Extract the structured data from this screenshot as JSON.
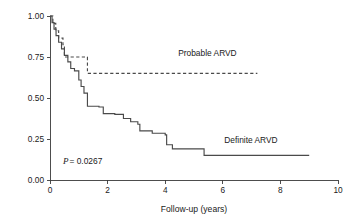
{
  "chart_data": {
    "type": "line",
    "title": "",
    "subtitle": "",
    "xlabel": "Follow-up (years)",
    "ylabel": "",
    "xlim": [
      0,
      10
    ],
    "ylim": [
      0,
      1
    ],
    "grid": false,
    "legend_position": "inline-annotation",
    "xticks": [
      0,
      2,
      4,
      6,
      8,
      10
    ],
    "xticklabels": [
      "0",
      "2",
      "4",
      "6",
      "8",
      "10"
    ],
    "yticks": [
      0,
      0.25,
      0.5,
      0.75,
      1
    ],
    "yticklabels": [
      "0.00",
      "0.25",
      "0.50",
      "0.75",
      "1.00"
    ],
    "annotations": [
      {
        "name": "p-value",
        "p_symbol": "P",
        "text": " = 0.0267",
        "x": 0.45,
        "y": 0.095
      }
    ],
    "series": [
      {
        "name": "Definite ARVD",
        "style": "solid",
        "label": "Definite ARVD",
        "label_x": 6.05,
        "label_y": 0.225,
        "step": "post",
        "x": [
          0.0,
          0.07,
          0.14,
          0.21,
          0.3,
          0.4,
          0.5,
          0.62,
          0.72,
          0.85,
          1.0,
          1.08,
          1.18,
          1.3,
          1.7,
          1.85,
          2.25,
          2.55,
          2.8,
          3.05,
          3.12,
          3.55,
          4.0,
          4.05,
          4.25,
          5.35,
          9.0
        ],
        "y": [
          1.0,
          0.96,
          0.92,
          0.88,
          0.84,
          0.8,
          0.76,
          0.72,
          0.68,
          0.665,
          0.61,
          0.57,
          0.53,
          0.45,
          0.445,
          0.405,
          0.4,
          0.375,
          0.355,
          0.34,
          0.3,
          0.285,
          0.275,
          0.215,
          0.19,
          0.15,
          0.15
        ]
      },
      {
        "name": "Probable ARVD",
        "style": "dashed",
        "label": "Probable ARVD",
        "label_x": 4.45,
        "label_y": 0.755,
        "step": "post",
        "x": [
          0.0,
          0.1,
          0.2,
          0.3,
          0.45,
          0.5,
          1.25,
          1.3,
          7.2
        ],
        "y": [
          1.0,
          0.955,
          0.91,
          0.865,
          0.825,
          0.75,
          0.75,
          0.65,
          0.65
        ]
      }
    ],
    "colors": {
      "line": "#4a4a4a",
      "axis": "#3a3a3a",
      "text": "#1a1a1a",
      "background": "#ffffff"
    }
  }
}
